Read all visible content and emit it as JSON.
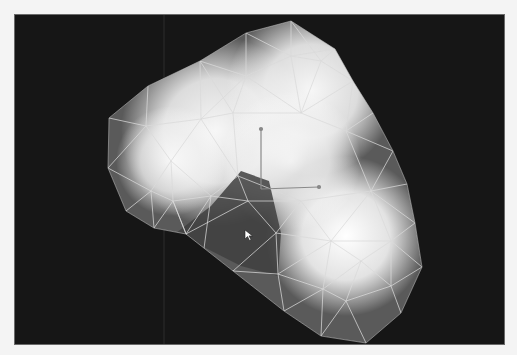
{
  "viewport": {
    "background": "#161616",
    "border": "#6a6a6a",
    "guide_lines_x": [
      163
    ],
    "mesh": {
      "fill_base": "#5a5a5a",
      "wire_color": "#d9d9d9",
      "outline": [
        [
          108,
          117
        ],
        [
          147,
          85
        ],
        [
          199,
          60
        ],
        [
          245,
          32
        ],
        [
          290,
          20
        ],
        [
          334,
          48
        ],
        [
          352,
          80
        ],
        [
          372,
          112
        ],
        [
          392,
          150
        ],
        [
          406,
          183
        ],
        [
          414,
          222
        ],
        [
          421,
          266
        ],
        [
          400,
          312
        ],
        [
          365,
          342
        ],
        [
          320,
          335
        ],
        [
          283,
          310
        ],
        [
          232,
          270
        ],
        [
          185,
          233
        ],
        [
          153,
          227
        ],
        [
          125,
          210
        ],
        [
          107,
          167
        ]
      ],
      "inner_vertices": [
        [
          145,
          125
        ],
        [
          200,
          118
        ],
        [
          245,
          75
        ],
        [
          290,
          55
        ],
        [
          320,
          60
        ],
        [
          170,
          160
        ],
        [
          232,
          112
        ],
        [
          300,
          112
        ],
        [
          345,
          130
        ],
        [
          172,
          200
        ],
        [
          210,
          195
        ],
        [
          237,
          175
        ],
        [
          247,
          200
        ],
        [
          275,
          232
        ],
        [
          277,
          273
        ],
        [
          322,
          288
        ],
        [
          345,
          300
        ],
        [
          360,
          260
        ],
        [
          390,
          240
        ],
        [
          390,
          285
        ],
        [
          330,
          240
        ],
        [
          300,
          200
        ],
        [
          370,
          190
        ],
        [
          200,
          270
        ],
        [
          150,
          190
        ]
      ],
      "glows": [
        {
          "cx": 215,
          "cy": 130,
          "r": 95,
          "opacity": 0.95
        },
        {
          "cx": 310,
          "cy": 90,
          "r": 85,
          "opacity": 0.95
        },
        {
          "cx": 345,
          "cy": 235,
          "r": 80,
          "opacity": 1.0
        },
        {
          "cx": 290,
          "cy": 160,
          "r": 70,
          "opacity": 0.85
        },
        {
          "cx": 170,
          "cy": 160,
          "r": 55,
          "opacity": 0.8
        }
      ],
      "dark_pocket": {
        "points": [
          [
            175,
            232
          ],
          [
            210,
            205
          ],
          [
            240,
            170
          ],
          [
            268,
            180
          ],
          [
            280,
            232
          ],
          [
            277,
            275
          ],
          [
            240,
            265
          ]
        ],
        "color": "#404040"
      }
    },
    "gizmo": {
      "origin": [
        260,
        188
      ],
      "y_axis_end": [
        260,
        128
      ],
      "x_axis_end": [
        318,
        186
      ],
      "color": "#8a8a8a"
    },
    "cursor": {
      "x": 244,
      "y": 229
    }
  }
}
